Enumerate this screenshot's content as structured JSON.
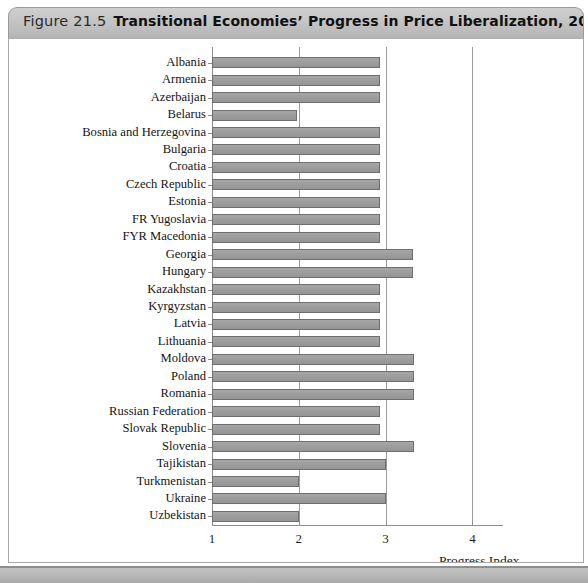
{
  "figure": {
    "number_label": "Figure 21.5",
    "title": "Transitional Economies’ Progress in Price Liberalization, 2001"
  },
  "chart_data": {
    "type": "bar",
    "orientation": "horizontal",
    "title": "Transitional Economies’ Progress in Price Liberalization, 2001",
    "xlabel": "Progress Index",
    "ylabel": "",
    "xlim": [
      1,
      4.35
    ],
    "xticks": [
      1,
      2,
      3,
      4
    ],
    "xtick_labels": [
      "1",
      "2",
      "3",
      "4"
    ],
    "grid": "vertical gridlines at x = 2, 3, 4",
    "legend": "none",
    "categories": [
      "Albania",
      "Armenia",
      "Azerbaijan",
      "Belarus",
      "Bosnia and Herzegovina",
      "Bulgaria",
      "Croatia",
      "Czech Republic",
      "Estonia",
      "FR Yugoslavia",
      "FYR Macedonia",
      "Georgia",
      "Hungary",
      "Kazakhstan",
      "Kyrgyzstan",
      "Latvia",
      "Lithuania",
      "Moldova",
      "Poland",
      "Romania",
      "Russian Federation",
      "Slovak Republic",
      "Slovenia",
      "Tajikistan",
      "Turkmenistan",
      "Ukraine",
      "Uzbekistan"
    ],
    "values": [
      2.94,
      2.94,
      2.94,
      1.98,
      2.94,
      2.94,
      2.94,
      2.94,
      2.94,
      2.94,
      2.94,
      3.31,
      3.31,
      2.94,
      2.94,
      2.94,
      2.94,
      3.33,
      3.33,
      3.33,
      2.94,
      2.94,
      3.33,
      3.0,
      2.0,
      3.0,
      2.0
    ]
  },
  "colors": {
    "bar_fill": "#9d9d9d",
    "bar_edge": "#6e6e6e",
    "axis": "#8d8d8d",
    "title_bar": "#c4c4c4",
    "text": "#141414"
  }
}
